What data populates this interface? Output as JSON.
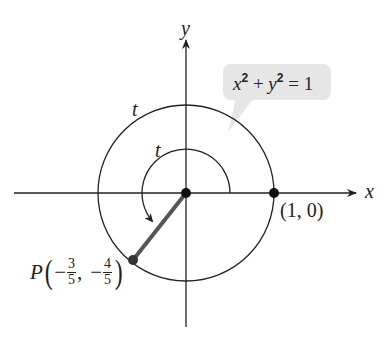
{
  "diagram": {
    "axes": {
      "x_label": "x",
      "y_label": "y"
    },
    "equation": {
      "lhs_x": "x",
      "exp1": "2",
      "plus": " + ",
      "lhs_y": "y",
      "exp2": "2",
      "rhs": " = 1"
    },
    "arc_labels": {
      "outer": "t",
      "inner": "t"
    },
    "points": {
      "start": {
        "label": "(1, 0)"
      },
      "P": {
        "name": "P",
        "x_sign": "−",
        "x_num": "3",
        "x_den": "5",
        "sep": ",",
        "y_sign": "−",
        "y_num": "4",
        "y_den": "5"
      }
    },
    "colors": {
      "line": "#222222",
      "segment": "#555555",
      "callout_bg": "#e6e6e6"
    }
  }
}
